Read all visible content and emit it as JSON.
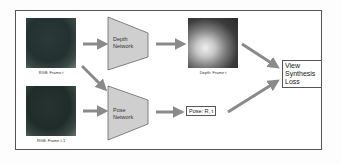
{
  "diagram": {
    "inputs": [
      {
        "label": "RGB: Frame t"
      },
      {
        "label": "RGB: Frame t-1"
      }
    ],
    "networks": [
      {
        "name": "Depth",
        "line2": "Network"
      },
      {
        "name": "Pose",
        "line2": "Network"
      }
    ],
    "outputs": {
      "depth_label": "Depth: Frame t",
      "pose_label": "Pose: R, t"
    },
    "loss": {
      "lines": [
        "View",
        "Synthesis",
        "Loss"
      ]
    },
    "colors": {
      "network_fill": "#cfcfcf",
      "arrow": "#8a8a8a",
      "border": "#555555"
    }
  }
}
